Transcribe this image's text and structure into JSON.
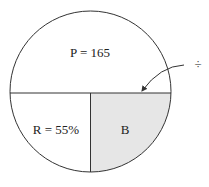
{
  "diagram": {
    "labels": {
      "top": "P = 165",
      "bottom_left": "R = 55%",
      "bottom_right": "B",
      "operator": "÷"
    },
    "colors": {
      "stroke": "#333333",
      "shaded": "#e6e6e6",
      "background": "#ffffff"
    }
  }
}
